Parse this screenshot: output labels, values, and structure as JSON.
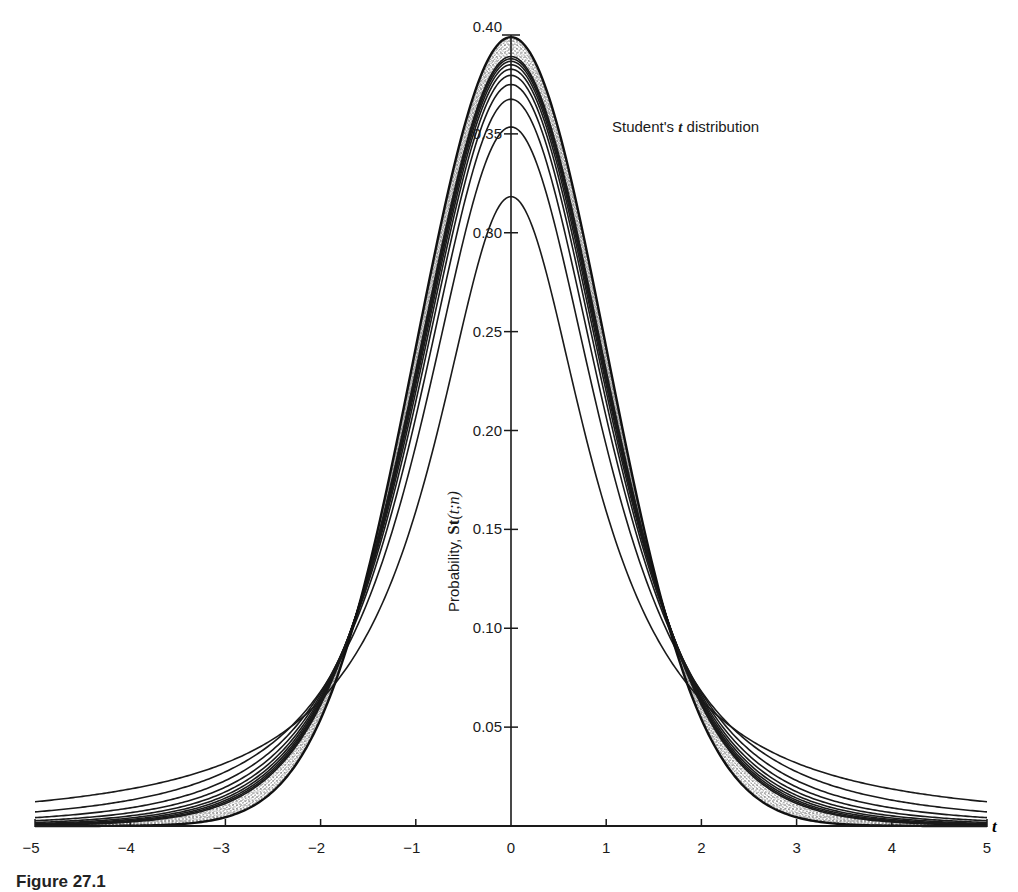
{
  "chart_data": {
    "type": "line",
    "title": "Student's t distribution",
    "title_parts": {
      "pre": "Student's ",
      "var": "t",
      "post": " distribution"
    },
    "xlabel": "t",
    "ylabel": "Probability,  St(t;n)",
    "ylabel_parts": {
      "pre": "Probability,  ",
      "func": "St",
      "args": "(t;n)"
    },
    "xlim": [
      -5,
      5
    ],
    "ylim": [
      0,
      0.4
    ],
    "xticks": [
      -5,
      -4,
      -3,
      -2,
      -1,
      0,
      1,
      2,
      3,
      4,
      5
    ],
    "xtick_labels": [
      "−5",
      "−4",
      "−3",
      "−2",
      "−1",
      "0",
      "1",
      "2",
      "3",
      "4",
      "5"
    ],
    "yticks": [
      0.05,
      0.1,
      0.15,
      0.2,
      0.25,
      0.3,
      0.35,
      0.4
    ],
    "ytick_labels": [
      "0.05",
      "0.10",
      "0.15",
      "0.20",
      "0.25",
      "0.30",
      "0.35",
      "0.40"
    ],
    "grid": false,
    "legend": null,
    "distinct_series_df": [
      1,
      2,
      3,
      4,
      5,
      6,
      7,
      8,
      9,
      10
    ],
    "stippled_band_df": [
      12,
      15,
      20,
      30,
      50,
      100,
      "inf"
    ],
    "series": [
      {
        "name": "n=1",
        "peak": 0.3183,
        "at_t2": 0.0637,
        "at_t5": 0.0122
      },
      {
        "name": "n=2",
        "peak": 0.3536,
        "at_t2": 0.068,
        "at_t5": 0.0071
      },
      {
        "name": "n=3",
        "peak": 0.3676,
        "at_t2": 0.0675,
        "at_t5": 0.0042
      },
      {
        "name": "n=4",
        "peak": 0.375,
        "at_t2": 0.0663,
        "at_t5": 0.0025
      },
      {
        "name": "n=5",
        "peak": 0.3796,
        "at_t2": 0.0651,
        "at_t5": 0.0018
      },
      {
        "name": "n=6",
        "peak": 0.3827,
        "at_t2": 0.064,
        "at_t5": 0.0012
      },
      {
        "name": "n=7",
        "peak": 0.385,
        "at_t2": 0.0632,
        "at_t5": 0.0009
      },
      {
        "name": "n=8",
        "peak": 0.3867,
        "at_t2": 0.0624,
        "at_t5": 0.0007
      },
      {
        "name": "n=9",
        "peak": 0.388,
        "at_t2": 0.0617,
        "at_t5": 0.0005
      },
      {
        "name": "n=10",
        "peak": 0.3891,
        "at_t2": 0.0611,
        "at_t5": 0.0004
      },
      {
        "name": "n=∞ (normal)",
        "peak": 0.3989,
        "at_t2": 0.054,
        "at_t5": 0.0
      }
    ]
  },
  "caption": {
    "text": "Figure 27.1"
  },
  "colors": {
    "ink": "#1a1a1a",
    "background": "#ffffff",
    "stipple": "#555555"
  }
}
